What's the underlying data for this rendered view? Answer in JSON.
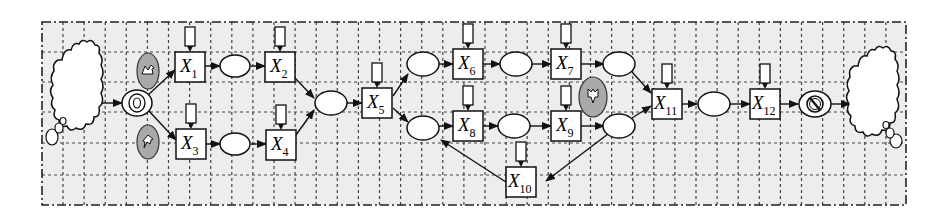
{
  "diagram": {
    "type": "workflow-petri-net",
    "colors": {
      "background": "#ffffff",
      "grid_fill": "#ededed",
      "grid_line": "#444444",
      "stroke": "#111111",
      "node_fill": "#ffffff",
      "event_fill": "#a9a9a9"
    },
    "source_cloud": {
      "name": "environment-input"
    },
    "sink_cloud": {
      "name": "environment-output"
    },
    "start_node": {
      "name": "start-event"
    },
    "end_node": {
      "name": "end-event"
    },
    "events": [
      {
        "id": "ev1",
        "name": "event-upper-left",
        "glyph": "zigzag-arrow"
      },
      {
        "id": "ev2",
        "name": "event-lower-left",
        "glyph": "hook-arrow"
      },
      {
        "id": "ev3",
        "name": "event-right",
        "glyph": "down-arrow"
      }
    ],
    "transitions": [
      {
        "id": "X1",
        "base": "X",
        "sub": "1"
      },
      {
        "id": "X2",
        "base": "X",
        "sub": "2"
      },
      {
        "id": "X3",
        "base": "X",
        "sub": "3"
      },
      {
        "id": "X4",
        "base": "X",
        "sub": "4"
      },
      {
        "id": "X5",
        "base": "X",
        "sub": "5"
      },
      {
        "id": "X6",
        "base": "X",
        "sub": "6"
      },
      {
        "id": "X7",
        "base": "X",
        "sub": "7"
      },
      {
        "id": "X8",
        "base": "X",
        "sub": "8"
      },
      {
        "id": "X9",
        "base": "X",
        "sub": "9"
      },
      {
        "id": "X10",
        "base": "X",
        "sub": "10"
      },
      {
        "id": "X11",
        "base": "X",
        "sub": "11"
      },
      {
        "id": "X12",
        "base": "X",
        "sub": "12"
      }
    ],
    "places": [
      "P1",
      "P2",
      "P3",
      "P4",
      "P5",
      "P6",
      "P7",
      "P8",
      "P9",
      "P10",
      "P11"
    ],
    "edges": [
      [
        "source",
        "start"
      ],
      [
        "start",
        "X1"
      ],
      [
        "start",
        "X3"
      ],
      [
        "X1",
        "P1"
      ],
      [
        "P1",
        "X2"
      ],
      [
        "X3",
        "P2"
      ],
      [
        "P2",
        "X4"
      ],
      [
        "X2",
        "P3"
      ],
      [
        "X4",
        "P3"
      ],
      [
        "P3",
        "X5"
      ],
      [
        "X5",
        "P4"
      ],
      [
        "X5",
        "P5"
      ],
      [
        "P4",
        "X6"
      ],
      [
        "X6",
        "P6"
      ],
      [
        "P6",
        "X7"
      ],
      [
        "X7",
        "P7"
      ],
      [
        "P5",
        "X8"
      ],
      [
        "X8",
        "P8"
      ],
      [
        "P8",
        "X9"
      ],
      [
        "X9",
        "P9"
      ],
      [
        "P9",
        "X10"
      ],
      [
        "X10",
        "P5"
      ],
      [
        "P7",
        "X11"
      ],
      [
        "P9",
        "X11"
      ],
      [
        "X11",
        "P10"
      ],
      [
        "P10",
        "X12"
      ],
      [
        "X12",
        "end"
      ],
      [
        "end",
        "sink"
      ]
    ]
  }
}
